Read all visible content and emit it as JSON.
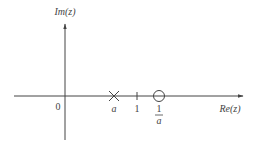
{
  "diagram": {
    "axes": {
      "x_label": "Re(z)",
      "y_label": "Im(z)",
      "origin_label": "0"
    },
    "markers": [
      {
        "type": "pole",
        "symbol": "×",
        "label": "a",
        "position": "a"
      },
      {
        "type": "tick",
        "label": "1",
        "position": 1
      },
      {
        "type": "zero",
        "symbol": "○",
        "label_numerator": "1",
        "label_denominator": "a",
        "position": "1/a"
      }
    ],
    "colors": {
      "stroke": "#444444",
      "background": "#ffffff"
    }
  }
}
